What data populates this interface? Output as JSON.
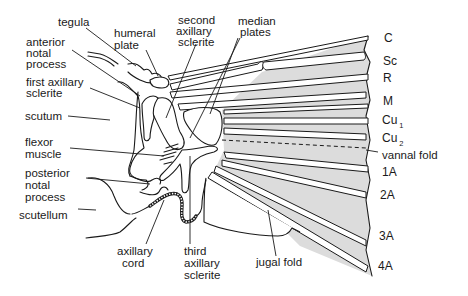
{
  "figure": {
    "labels": {
      "tegula": "tegula",
      "humeral_plate": [
        "humeral",
        "plate"
      ],
      "anterior_notal_process": [
        "anterior",
        "notal",
        "process"
      ],
      "first_axillary_sclerite": [
        "first axillary",
        "sclerite"
      ],
      "scutum": "scutum",
      "flexor_muscle": [
        "flexor",
        "muscle"
      ],
      "posterior_notal_process": [
        "posterior",
        "notal",
        "process"
      ],
      "scutellum": "scutellum",
      "axillary_cord": [
        "axillary",
        "cord"
      ],
      "second_axillary_sclerite": [
        "second",
        "axillary",
        "sclerite"
      ],
      "median_plates": [
        "median",
        "plates"
      ],
      "third_axillary_sclerite": [
        "third",
        "axillary",
        "sclerite"
      ],
      "jugal_fold": "jugal fold",
      "vannal_fold": "vannal fold"
    },
    "veins": [
      {
        "name": "C",
        "sub": ""
      },
      {
        "name": "Sc",
        "sub": ""
      },
      {
        "name": "R",
        "sub": ""
      },
      {
        "name": "M",
        "sub": ""
      },
      {
        "name": "Cu",
        "sub": "1"
      },
      {
        "name": "Cu",
        "sub": "2"
      },
      {
        "name": "1A",
        "sub": ""
      },
      {
        "name": "2A",
        "sub": ""
      },
      {
        "name": "3A",
        "sub": ""
      },
      {
        "name": "4A",
        "sub": ""
      }
    ]
  }
}
